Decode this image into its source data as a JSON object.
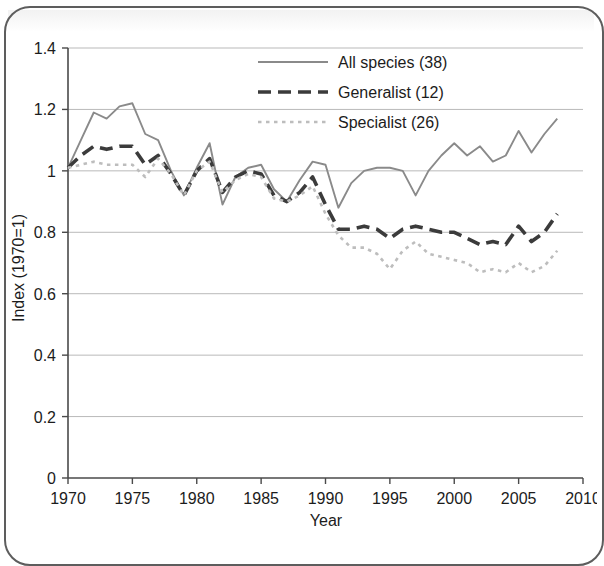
{
  "chart_data": {
    "type": "line",
    "title": "",
    "xlabel": "Year",
    "ylabel": "Index (1970=1)",
    "xlim": [
      1970,
      2010
    ],
    "ylim": [
      0,
      1.4
    ],
    "xticks": [
      1970,
      1975,
      1980,
      1985,
      1990,
      1995,
      2000,
      2005,
      2010
    ],
    "xtick_labels": [
      "1970",
      "1975",
      "1980",
      "1985",
      "1990",
      "1995",
      "2000",
      "2005",
      "2010"
    ],
    "yticks": [
      0,
      0.2,
      0.4,
      0.6,
      0.8,
      1,
      1.2,
      1.4
    ],
    "ytick_labels": [
      "0",
      "0.2",
      "0.4",
      "0.6",
      "0.8",
      "1",
      "1.2",
      "1.4"
    ],
    "grid": "horizontal",
    "legend_position": "top-center",
    "x": [
      1970,
      1971,
      1972,
      1973,
      1974,
      1975,
      1976,
      1977,
      1978,
      1979,
      1980,
      1981,
      1982,
      1983,
      1984,
      1985,
      1986,
      1987,
      1988,
      1989,
      1990,
      1991,
      1992,
      1993,
      1994,
      1995,
      1996,
      1997,
      1998,
      1999,
      2000,
      2001,
      2002,
      2003,
      2004,
      2005,
      2006,
      2007,
      2008
    ],
    "series": [
      {
        "name": "All species (38)",
        "label": "All species (38)",
        "count": 38,
        "style": "solid",
        "color": "#8a8a8a",
        "values": [
          1.01,
          1.1,
          1.19,
          1.17,
          1.21,
          1.22,
          1.12,
          1.1,
          1.0,
          0.92,
          1.01,
          1.09,
          0.89,
          0.98,
          1.01,
          1.02,
          0.94,
          0.9,
          0.97,
          1.03,
          1.02,
          0.88,
          0.96,
          1.0,
          1.01,
          1.01,
          1.0,
          0.92,
          1.0,
          1.05,
          1.09,
          1.05,
          1.08,
          1.03,
          1.05,
          1.13,
          1.06,
          1.12,
          1.17
        ]
      },
      {
        "name": "Generalist (12)",
        "label": "Generalist (12)",
        "count": 12,
        "style": "dashed",
        "color": "#3b3b3b",
        "values": [
          1.01,
          1.05,
          1.08,
          1.07,
          1.08,
          1.08,
          1.02,
          1.05,
          0.99,
          0.92,
          1.0,
          1.04,
          0.93,
          0.98,
          1.0,
          0.99,
          0.92,
          0.9,
          0.93,
          0.98,
          0.89,
          0.81,
          0.81,
          0.82,
          0.81,
          0.78,
          0.81,
          0.82,
          0.81,
          0.8,
          0.8,
          0.78,
          0.76,
          0.77,
          0.76,
          0.82,
          0.77,
          0.8,
          0.86
        ]
      },
      {
        "name": "Specialist (26)",
        "label": "Specialist (26)",
        "count": 26,
        "style": "dotted",
        "color": "#bdbdbd",
        "values": [
          1.01,
          1.02,
          1.03,
          1.02,
          1.02,
          1.02,
          0.98,
          1.04,
          0.99,
          0.92,
          1.0,
          1.03,
          0.93,
          0.97,
          0.99,
          0.98,
          0.91,
          0.9,
          0.92,
          0.95,
          0.86,
          0.79,
          0.75,
          0.75,
          0.73,
          0.68,
          0.74,
          0.77,
          0.73,
          0.72,
          0.71,
          0.7,
          0.67,
          0.68,
          0.67,
          0.7,
          0.67,
          0.69,
          0.74
        ]
      }
    ]
  },
  "legend": {
    "items": [
      {
        "label": "All species (38)",
        "style": "solid"
      },
      {
        "label": "Generalist (12)",
        "style": "dashed"
      },
      {
        "label": "Specialist (26)",
        "style": "dotted"
      }
    ]
  },
  "axes": {
    "x_title": "Year",
    "y_title": "Index (1970=1)"
  }
}
